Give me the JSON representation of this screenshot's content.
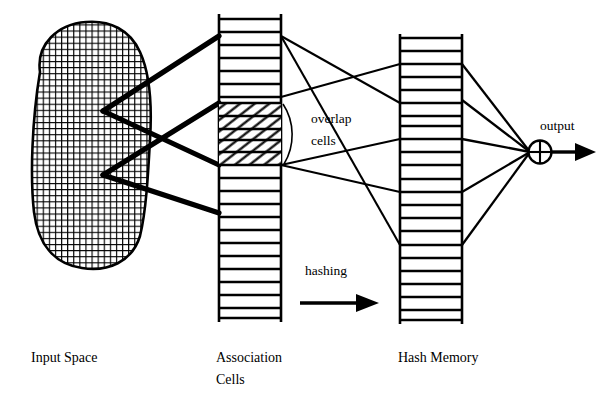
{
  "figure": {
    "type": "diagram",
    "labels": {
      "input_space": "Input Space",
      "association_cells_line1": "Association",
      "association_cells_line2": "Cells",
      "hash_memory": "Hash Memory",
      "overlap_line1": "overlap",
      "overlap_line2": "cells",
      "hashing": "hashing",
      "output": "output"
    },
    "colors": {
      "stroke": "#000000",
      "background": "#ffffff",
      "mesh": "#000000",
      "hatch": "#000000"
    },
    "input_space": {
      "shape": "rounded-blob",
      "fill": "fine-square-mesh",
      "receptive_field_vertices": 2
    },
    "association_cells": {
      "cell_count": 22,
      "highlighted_cells": 5,
      "highlight_fill": "diagonal-hatch",
      "highlight_start_index": 6,
      "x": 219,
      "width": 62,
      "top": 19,
      "bottom": 318
    },
    "hash_memory": {
      "cell_count": 22,
      "x": 400,
      "width": 62,
      "top": 38,
      "bottom": 320
    },
    "thick_projection_lines": 4,
    "hashing_lines": 4,
    "summation_lines": 5,
    "summing_node": {
      "glyph": "circle-plus",
      "cx": 540,
      "cy": 152,
      "r": 11
    },
    "arrows": [
      {
        "name": "hashing-arrow",
        "x1": 300,
        "y1": 303,
        "x2": 378,
        "y2": 303
      },
      {
        "name": "output-arrow",
        "x1": 551,
        "y1": 152,
        "x2": 595,
        "y2": 152
      }
    ]
  }
}
